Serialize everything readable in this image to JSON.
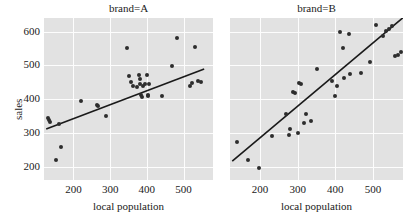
{
  "chart_data": {
    "type": "scatter",
    "title": "",
    "xlabel": "local population",
    "ylabel": "sales",
    "xlim": [
      120,
      580
    ],
    "ylim": [
      160,
      640
    ],
    "xticks": [
      200,
      300,
      400,
      500
    ],
    "yticks": [
      200,
      300,
      400,
      500,
      600
    ],
    "grid": true,
    "legend": false,
    "facet_variable": "brand",
    "point_color": "#2d2d2d",
    "line_color": "#1a1a1a",
    "panel_background": "#e2e2e2",
    "gridline_color": "#fdfdfd",
    "panels": [
      {
        "title": "brand=A",
        "facet_value": "A",
        "x": [
          132,
          134,
          136,
          152,
          160,
          166,
          222,
          264,
          268,
          290,
          345,
          352,
          358,
          362,
          372,
          378,
          380,
          382,
          384,
          386,
          390,
          394,
          400,
          402,
          404,
          406,
          440,
          468,
          482,
          518,
          524,
          530,
          540,
          548
        ],
        "y": [
          345,
          338,
          332,
          218,
          325,
          257,
          393,
          382,
          380,
          350,
          551,
          467,
          449,
          440,
          435,
          470,
          445,
          460,
          412,
          405,
          440,
          443,
          470,
          408,
          412,
          444,
          408,
          499,
          580,
          440,
          448,
          553,
          452,
          449
        ],
        "fit_line": {
          "x1": 126,
          "y1": 311,
          "x2": 556,
          "y2": 489,
          "slope": 0.414,
          "intercept": 259
        }
      },
      {
        "title": "brand=B",
        "facet_value": "B",
        "x": [
          138,
          168,
          196,
          232,
          268,
          276,
          280,
          288,
          292,
          300,
          304,
          310,
          318,
          322,
          336,
          352,
          392,
          398,
          404,
          412,
          420,
          424,
          436,
          440,
          468,
          492,
          508,
          528,
          536,
          544,
          552,
          560,
          566,
          574
        ],
        "y": [
          272,
          219,
          197,
          291,
          355,
          294,
          311,
          420,
          417,
          298,
          448,
          443,
          330,
          356,
          336,
          489,
          452,
          408,
          440,
          599,
          550,
          461,
          594,
          474,
          478,
          509,
          618,
          588,
          601,
          607,
          615,
          528,
          531,
          540
        ],
        "fit_line": {
          "x1": 126,
          "y1": 216,
          "x2": 580,
          "y2": 641,
          "slope": 0.936,
          "intercept": 98
        }
      }
    ]
  },
  "layout": {
    "panel_a": {
      "left": 44,
      "top": 18,
      "width": 169,
      "height": 162
    },
    "panel_b": {
      "left": 230,
      "top": 18,
      "width": 173,
      "height": 162
    }
  }
}
